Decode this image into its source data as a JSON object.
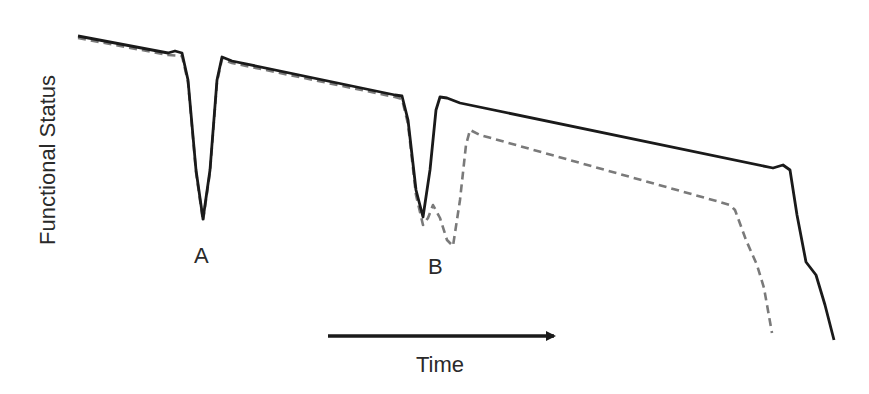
{
  "chart_data": {
    "type": "line",
    "title": "",
    "xlabel": "Time",
    "ylabel": "Functional Status",
    "grid": false,
    "legend": null,
    "axis_ticks": "none",
    "annotations": [
      {
        "text": "A",
        "x": 203,
        "y": 255,
        "note": "acute event A; both trajectories recover"
      },
      {
        "text": "B",
        "x": 436,
        "y": 255,
        "note": "acute event B; trajectories diverge"
      }
    ],
    "series": [
      {
        "name": "solid",
        "style": "solid",
        "color": "#1a1a1a",
        "points": [
          [
            78,
            36
          ],
          [
            168,
            53
          ],
          [
            175,
            51
          ],
          [
            182,
            53
          ],
          [
            188,
            80
          ],
          [
            196,
            170
          ],
          [
            203,
            219
          ],
          [
            210,
            170
          ],
          [
            217,
            80
          ],
          [
            222,
            57
          ],
          [
            232,
            61
          ],
          [
            395,
            95
          ],
          [
            402,
            96
          ],
          [
            408,
            120
          ],
          [
            416,
            190
          ],
          [
            423,
            217
          ],
          [
            430,
            170
          ],
          [
            436,
            110
          ],
          [
            440,
            97
          ],
          [
            447,
            98
          ],
          [
            460,
            103
          ],
          [
            773,
            168
          ],
          [
            783,
            165
          ],
          [
            790,
            170
          ],
          [
            797,
            215
          ],
          [
            806,
            262
          ],
          [
            816,
            275
          ],
          [
            825,
            305
          ],
          [
            834,
            340
          ]
        ]
      },
      {
        "name": "dashed",
        "style": "dashed",
        "color": "#7a7a7a",
        "points": [
          [
            78,
            38
          ],
          [
            168,
            55
          ],
          [
            182,
            56
          ],
          [
            188,
            82
          ],
          [
            196,
            172
          ],
          [
            203,
            221
          ],
          [
            210,
            172
          ],
          [
            217,
            82
          ],
          [
            222,
            59
          ],
          [
            232,
            63
          ],
          [
            395,
            97
          ],
          [
            402,
            99
          ],
          [
            408,
            124
          ],
          [
            416,
            195
          ],
          [
            423,
            225
          ],
          [
            428,
            218
          ],
          [
            433,
            205
          ],
          [
            440,
            218
          ],
          [
            447,
            240
          ],
          [
            453,
            246
          ],
          [
            460,
            200
          ],
          [
            466,
            145
          ],
          [
            470,
            130
          ],
          [
            480,
            135
          ],
          [
            720,
            202
          ],
          [
            730,
            205
          ],
          [
            735,
            210
          ],
          [
            746,
            240
          ],
          [
            757,
            265
          ],
          [
            764,
            288
          ],
          [
            772,
            333
          ]
        ]
      }
    ]
  },
  "arrow": {
    "x1": 328,
    "y1": 336,
    "x2": 562,
    "y2": 336
  }
}
